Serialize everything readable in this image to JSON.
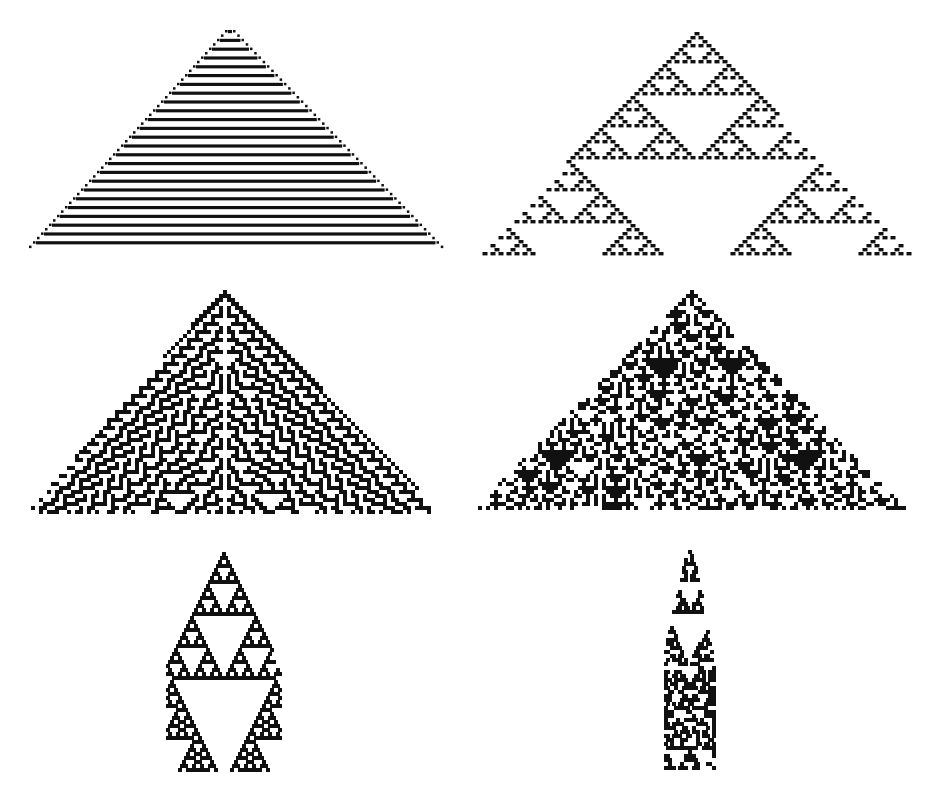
{
  "figure": {
    "background": "#ffffff",
    "ink": "#111111",
    "panels": [
      {
        "id": "p1",
        "label": "striped-triangle",
        "rule": 50,
        "k": 2,
        "apex": [
          230,
          30
        ],
        "base_y": 252,
        "base_x": [
          30,
          442
        ],
        "cell": 4.4
      },
      {
        "id": "p2",
        "label": "sierpinski-triangle",
        "rule": 18,
        "k": 2,
        "apex": [
          697,
          32
        ],
        "base_y": 255,
        "base_x": [
          480,
          910
        ],
        "cell": 4.0
      },
      {
        "id": "p3",
        "label": "chaotic-triangle",
        "rule": 30,
        "k": 2,
        "apex": [
          225,
          290
        ],
        "base_y": 512,
        "base_x": [
          28,
          440
        ],
        "cell": 4.0,
        "symmetric": true
      },
      {
        "id": "p4",
        "label": "complex-triangle",
        "rule": 150,
        "k": 2,
        "apex": [
          692,
          290
        ],
        "base_y": 510,
        "base_x": [
          475,
          905
        ],
        "cell": 4.0,
        "noise": true
      },
      {
        "id": "p5",
        "label": "narrow-nested-triangle",
        "rule": 90,
        "k": 2,
        "apex": [
          224,
          552
        ],
        "base_y": 772,
        "base_x": [
          113,
          325
        ],
        "cell": 4.0,
        "narrow": true
      },
      {
        "id": "p6",
        "label": "narrow-irregular-cone",
        "rule": 126,
        "k": 2,
        "apex": [
          690,
          550
        ],
        "base_y": 770,
        "base_x": [
          645,
          730
        ],
        "cell": 4.0,
        "narrow": true,
        "irregular": true
      }
    ]
  }
}
